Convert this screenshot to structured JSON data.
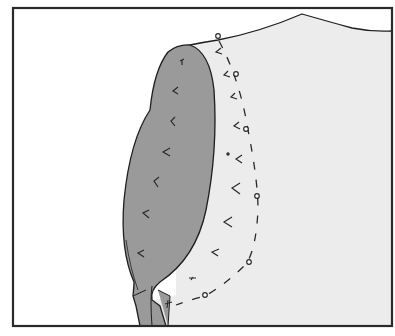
{
  "figure": {
    "colors": {
      "frame": "#2a2a2a",
      "background": "#ffffff",
      "garment_fill": "#ececec",
      "facing_fill": "#9a9a9a",
      "outline": "#1e1e1e",
      "marks": "#2a2a2a"
    },
    "frame": {
      "x": 13,
      "y": 8,
      "width": 379,
      "height": 318
    },
    "pins": [
      {
        "head": [
          218,
          36
        ],
        "tail": [
          222,
          46
        ]
      },
      {
        "head": [
          236,
          74
        ],
        "tail": [
          241,
          85
        ]
      },
      {
        "head": [
          246,
          129
        ],
        "tail": [
          249,
          142
        ]
      },
      {
        "head": [
          257,
          196
        ],
        "tail": [
          257,
          210
        ]
      },
      {
        "head": [
          249,
          262
        ],
        "tail": [
          240,
          268
        ]
      },
      {
        "head": [
          205,
          296
        ],
        "tail": [
          190,
          301
        ]
      }
    ],
    "tack_marks_on_facing": [
      [
        182,
        62
      ],
      [
        174,
        92
      ],
      [
        171,
        122
      ],
      [
        165,
        150
      ],
      [
        155,
        181
      ],
      [
        145,
        213
      ],
      [
        141,
        253
      ]
    ],
    "tack_marks_on_garment": [
      [
        219,
        50
      ],
      [
        226,
        74
      ],
      [
        233,
        96
      ],
      [
        236,
        124
      ],
      [
        238,
        158
      ],
      [
        235,
        188
      ],
      [
        227,
        222
      ],
      [
        213,
        252
      ],
      [
        193,
        280
      ]
    ]
  }
}
